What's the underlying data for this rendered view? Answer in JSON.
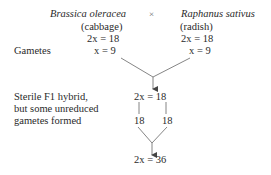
{
  "parents": {
    "left": {
      "species": "Brassica oleracea",
      "common_name": "(cabbage)",
      "chromosomes": "2x = 18",
      "gamete": "x = 9"
    },
    "cross_symbol": "×",
    "right": {
      "species": "Raphanus sativus",
      "common_name": "(radish)",
      "chromosomes": "2x = 18",
      "gamete": "x = 9"
    }
  },
  "labels": {
    "gametes": "Gametes",
    "hybrid_line1": "Sterile F1 hybrid,",
    "hybrid_line2": "but some unreduced",
    "hybrid_line3": "gametes formed"
  },
  "hybrid": {
    "chromosomes": "2x = 18",
    "unreduced_left": "18",
    "unreduced_right": "18"
  },
  "result": {
    "chromosomes": "2x = 36"
  },
  "colors": {
    "text": "#2a2a2a",
    "lines": "#777777"
  }
}
